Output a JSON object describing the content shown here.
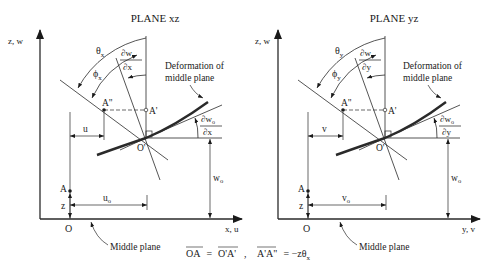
{
  "panels": [
    {
      "title": "PLANE xz",
      "axis_vertical": "z, w",
      "axis_horizontal": "x, u",
      "theta": "θ",
      "theta_sub": "x",
      "phi": "ϕ",
      "phi_sub": "x",
      "slope_num": "∂w",
      "slope_num_sub": "o",
      "slope_den": "∂x",
      "deformation_label_1": "Deformation of",
      "deformation_label_2": "middle plane",
      "point_A_double_prime": "A\"",
      "point_A_prime": "A'",
      "point_O_prime": "O'",
      "point_A": "A",
      "point_O": "O",
      "dim_z": "z",
      "dim_disp": "u",
      "dim_disp0": "u",
      "dim_disp0_sub": "o",
      "dim_w0": "w",
      "dim_w0_sub": "o",
      "middle_plane_label": "Middle plane"
    },
    {
      "title": "PLANE yz",
      "axis_vertical": "z, w",
      "axis_horizontal": "y, v",
      "theta": "θ",
      "theta_sub": "y",
      "phi": "ϕ",
      "phi_sub": "y",
      "slope_num": "∂w",
      "slope_num_sub": "o",
      "slope_den": "∂y",
      "deformation_label_1": "Deformation of",
      "deformation_label_2": "middle plane",
      "point_A_double_prime": "A\"",
      "point_A_prime": "A'",
      "point_O_prime": "O'",
      "point_A": "A",
      "point_O": "O",
      "dim_z": "z",
      "dim_disp": "v",
      "dim_disp0": "v",
      "dim_disp0_sub": "o",
      "dim_w0": "w",
      "dim_w0_sub": "o",
      "middle_plane_label": "Middle plane"
    }
  ],
  "equations": {
    "eq1_lhs": "OA",
    "eq1_op": " = ",
    "eq1_rhs": "O'A'",
    "separator": ",",
    "eq2_lhs": "A'A\"",
    "eq2_op": " = −zθ",
    "eq2_sub": "x"
  }
}
